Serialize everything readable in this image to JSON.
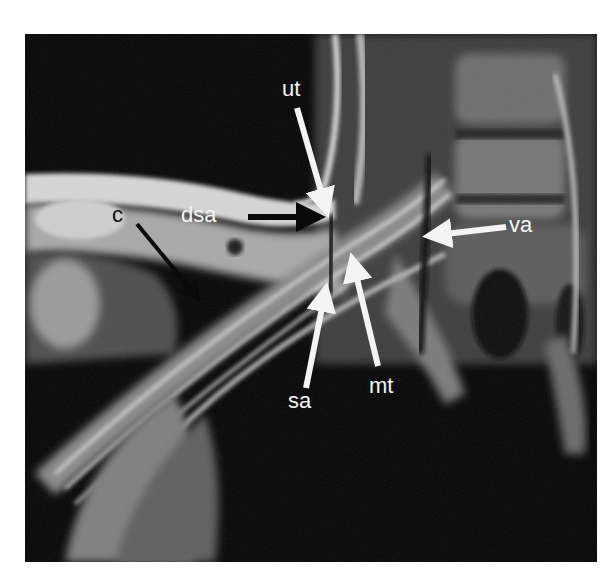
{
  "figure": {
    "type": "MRI scan (T1-weighted, oblique coronal) with anatomical annotations",
    "background": "#ffffff",
    "image_bg": "#050505"
  },
  "labels": [
    {
      "id": "ut",
      "text": "ut",
      "color": "white",
      "arrow_color": "white",
      "x": 282,
      "y": 78
    },
    {
      "id": "dsa",
      "text": "dsa",
      "color": "white",
      "arrow_color": "black",
      "x": 181,
      "y": 204
    },
    {
      "id": "c",
      "text": "c",
      "color": "black",
      "arrow_color": "black",
      "x": 112,
      "y": 204
    },
    {
      "id": "va",
      "text": "va",
      "color": "white",
      "arrow_color": "white",
      "x": 509,
      "y": 214
    },
    {
      "id": "sa",
      "text": "sa",
      "color": "white",
      "arrow_color": "white",
      "x": 288,
      "y": 390
    },
    {
      "id": "mt",
      "text": "mt",
      "color": "white",
      "arrow_color": "white",
      "x": 369,
      "y": 375
    }
  ]
}
